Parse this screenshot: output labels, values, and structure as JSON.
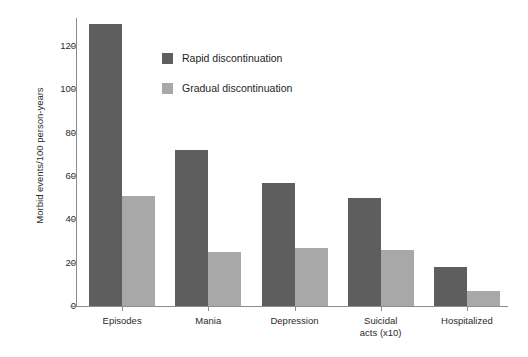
{
  "chart_data": {
    "type": "bar",
    "title": "",
    "xlabel": "",
    "ylabel": "Morbid events/100 person-years",
    "ylim": [
      0,
      135
    ],
    "yticks": [
      0,
      20,
      40,
      60,
      80,
      100,
      120
    ],
    "grid": false,
    "legend_position": "inside-top-left",
    "categories": [
      "Episodes",
      "Mania",
      "Depression",
      "Suicidal\nacts (x10)",
      "Hospitalized"
    ],
    "series": [
      {
        "name": "Rapid discontinuation",
        "color": "#5e5e5e",
        "values": [
          130,
          72,
          57,
          50,
          18
        ]
      },
      {
        "name": "Gradual discontinuation",
        "color": "#a8a8a8",
        "values": [
          51,
          25,
          27,
          26,
          7
        ]
      }
    ]
  },
  "axis": {
    "y_title": "Morbid events/100 person-years",
    "y_tick_labels": [
      "0",
      "20",
      "40",
      "60",
      "80",
      "100",
      "120"
    ],
    "x_tick_labels": [
      "Episodes",
      "Mania",
      "Depression",
      "Suicidal\nacts (x10)",
      "Hospitalized"
    ]
  },
  "legend": {
    "items": [
      {
        "label": "Rapid discontinuation",
        "color": "#5e5e5e"
      },
      {
        "label": "Gradual discontinuation",
        "color": "#a8a8a8"
      }
    ]
  },
  "colors": {
    "rapid": "#5e5e5e",
    "gradual": "#a8a8a8",
    "axis": "#8c8c8c",
    "text": "#2b2b2b",
    "background": "#ffffff"
  }
}
